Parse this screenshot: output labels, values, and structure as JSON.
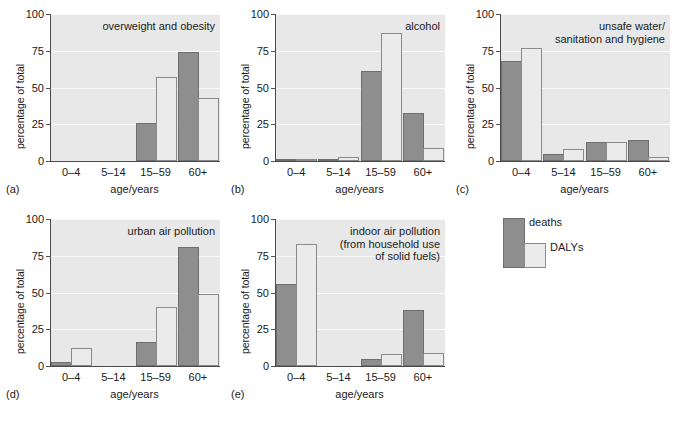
{
  "figure": {
    "axis": {
      "ylabel": "percentage of total",
      "xlabel": "age/years",
      "yticks": [
        "0",
        "25",
        "50",
        "75",
        "100"
      ],
      "ymin": 0,
      "ymax": 100,
      "categories": [
        "0–4",
        "5–14",
        "15–59",
        "60+"
      ]
    },
    "legend": {
      "deaths_label": "deaths",
      "dalys_label": "DALYs"
    },
    "colors": {
      "deaths": "#8e8e8e",
      "dalys": "#ebebeb",
      "plot_background": "#e8e8e8",
      "gridline": "#fafafa",
      "axis": "#4a4a4a"
    },
    "panel_letters": [
      "(a)",
      "(b)",
      "(c)",
      "(d)",
      "(e)"
    ]
  },
  "chart_data": [
    {
      "type": "bar",
      "panel": "(a)",
      "title": "overweight and obesity",
      "categories": [
        "0–4",
        "5–14",
        "15–59",
        "60+"
      ],
      "series": [
        {
          "name": "deaths",
          "values": [
            0,
            0,
            26,
            74
          ]
        },
        {
          "name": "DALYs",
          "values": [
            0,
            0,
            57,
            43
          ]
        }
      ],
      "xlabel": "age/years",
      "ylabel": "percentage of total",
      "ylim": [
        0,
        100
      ],
      "grid": true,
      "legend_position": "external-right"
    },
    {
      "type": "bar",
      "panel": "(b)",
      "title": "alcohol",
      "categories": [
        "0–4",
        "5–14",
        "15–59",
        "60+"
      ],
      "series": [
        {
          "name": "deaths",
          "values": [
            1,
            1,
            61,
            33
          ]
        },
        {
          "name": "DALYs",
          "values": [
            1,
            3,
            87,
            9
          ]
        }
      ],
      "xlabel": "age/years",
      "ylabel": "percentage of total",
      "ylim": [
        0,
        100
      ],
      "grid": true,
      "legend_position": "external-right"
    },
    {
      "type": "bar",
      "panel": "(c)",
      "title": "unsafe water/\nsanitation and hygiene",
      "categories": [
        "0–4",
        "5–14",
        "15–59",
        "60+"
      ],
      "series": [
        {
          "name": "deaths",
          "values": [
            68,
            5,
            13,
            14
          ]
        },
        {
          "name": "DALYs",
          "values": [
            77,
            8,
            13,
            3
          ]
        }
      ],
      "xlabel": "age/years",
      "ylabel": "percentage of total",
      "ylim": [
        0,
        100
      ],
      "grid": true,
      "legend_position": "external-right"
    },
    {
      "type": "bar",
      "panel": "(d)",
      "title": "urban air pollution",
      "categories": [
        "0–4",
        "5–14",
        "15–59",
        "60+"
      ],
      "series": [
        {
          "name": "deaths",
          "values": [
            3,
            0,
            16,
            81
          ]
        },
        {
          "name": "DALYs",
          "values": [
            12,
            0,
            40,
            49
          ]
        }
      ],
      "xlabel": "age/years",
      "ylabel": "percentage of total",
      "ylim": [
        0,
        100
      ],
      "grid": true,
      "legend_position": "external-right"
    },
    {
      "type": "bar",
      "panel": "(e)",
      "title": "indoor air pollution\n(from household use\nof solid fuels)",
      "categories": [
        "0–4",
        "5–14",
        "15–59",
        "60+"
      ],
      "series": [
        {
          "name": "deaths",
          "values": [
            56,
            0,
            5,
            38
          ]
        },
        {
          "name": "DALYs",
          "values": [
            83,
            0,
            8,
            9
          ]
        }
      ],
      "xlabel": "age/years",
      "ylabel": "percentage of total",
      "ylim": [
        0,
        100
      ],
      "grid": true,
      "legend_position": "external-right"
    }
  ]
}
